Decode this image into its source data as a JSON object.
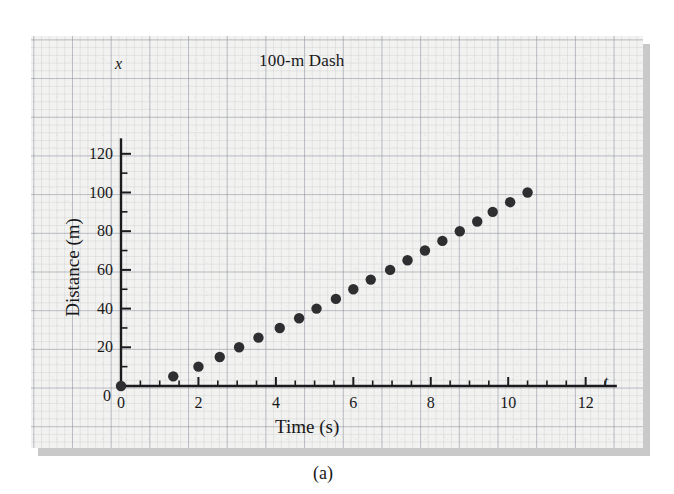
{
  "figure": {
    "caption": "(a)"
  },
  "chart_data": {
    "type": "scatter",
    "title": "100-m Dash",
    "xlabel": "Time (s)",
    "ylabel": "Distance (m)",
    "x_axis_symbol": "t",
    "y_axis_symbol": "x",
    "xlim": [
      0,
      12.6
    ],
    "ylim": [
      0,
      128
    ],
    "x_ticks": [
      0,
      2,
      4,
      6,
      8,
      10,
      12
    ],
    "x_tick_labels": [
      "0",
      "2",
      "4",
      "6",
      "8",
      "10",
      "12"
    ],
    "x_minor_tick_step": 0.5,
    "y_ticks": [
      0,
      20,
      40,
      60,
      80,
      100,
      120
    ],
    "y_tick_labels": [
      "0",
      "20",
      "40",
      "60",
      "80",
      "100",
      "120"
    ],
    "y_minor_tick_step": 10,
    "grid": true,
    "grid_style": "graph-paper",
    "legend": null,
    "marker": {
      "shape": "circle",
      "color": "#2e2e30",
      "radius": 5.2
    },
    "series": [
      {
        "name": "runner position",
        "x": [
          0.0,
          1.35,
          2.0,
          2.55,
          3.05,
          3.55,
          4.1,
          4.6,
          5.05,
          5.55,
          6.0,
          6.45,
          6.95,
          7.4,
          7.85,
          8.3,
          8.75,
          9.2,
          9.6,
          10.05,
          10.5
        ],
        "y": [
          0,
          5,
          10,
          15,
          20,
          25,
          30,
          35,
          40,
          45,
          50,
          55,
          60,
          65,
          70,
          75,
          80,
          85,
          90,
          95,
          100
        ]
      }
    ]
  }
}
